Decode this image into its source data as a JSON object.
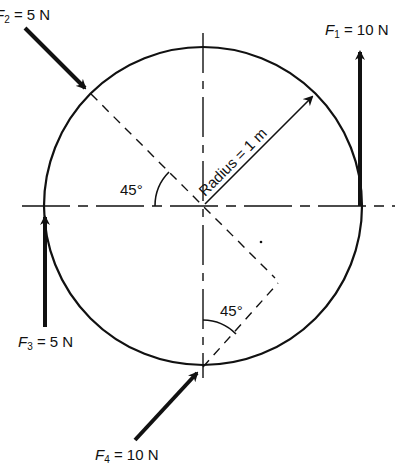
{
  "diagram": {
    "circle": {
      "radius_label": "Radius = 1 m"
    },
    "forces": [
      {
        "id": "F1",
        "symbol": "F",
        "subscript": "1",
        "eq": " = 10 N",
        "magnitude": "10 N",
        "direction": "vertical up, tangent at right edge"
      },
      {
        "id": "F2",
        "symbol": "F",
        "subscript": "2",
        "eq": " = 5 N",
        "magnitude": "5 N",
        "direction": "down-right at 45°, toward upper-left of circle"
      },
      {
        "id": "F3",
        "symbol": "F",
        "subscript": "3",
        "eq": " = 5 N",
        "magnitude": "5 N",
        "direction": "vertical up, tangent at left edge"
      },
      {
        "id": "F4",
        "symbol": "F",
        "subscript": "4",
        "eq": " = 10 N",
        "magnitude": "10 N",
        "direction": "up-right at 45°, toward bottom of circle"
      }
    ],
    "angles": [
      {
        "label": "45°",
        "location": "left, between horizontal axis and F2 line of action"
      },
      {
        "label": "45°",
        "location": "bottom, between vertical axis and F4 line of action"
      }
    ]
  }
}
